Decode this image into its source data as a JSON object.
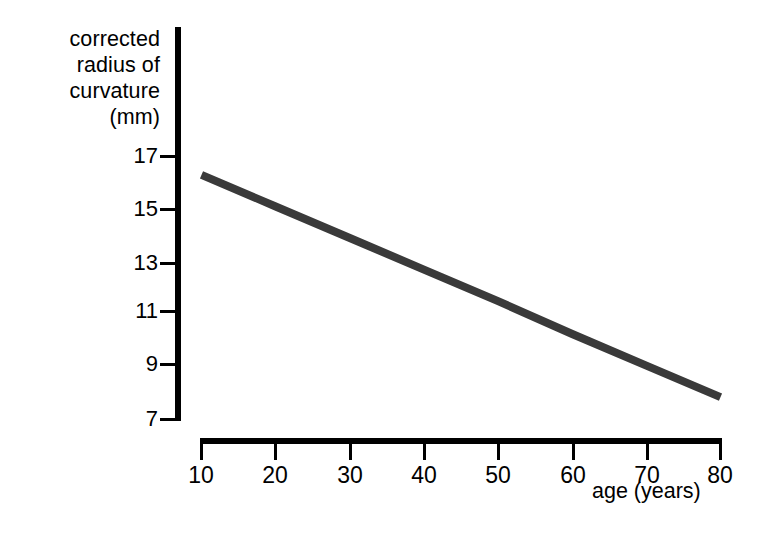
{
  "chart_data": {
    "type": "line",
    "title": "",
    "subtitle": "",
    "xlabel": "age (years)",
    "ylabel": "corrected radius of curvature (mm)",
    "ylabel_lines": [
      "corrected",
      "radius of",
      "curvature",
      "(mm)"
    ],
    "xlim": [
      10,
      80
    ],
    "ylim": [
      7,
      17
    ],
    "xticks": [
      10,
      20,
      30,
      40,
      50,
      60,
      70,
      80
    ],
    "xtick_labels": [
      "10",
      "20",
      "30",
      "40",
      "50",
      "60",
      "70",
      "80"
    ],
    "yticks": [
      17,
      15,
      13,
      11,
      9,
      7
    ],
    "ytick_labels": [
      "17",
      "15",
      "13",
      "11",
      "9",
      "7"
    ],
    "grid": false,
    "legend": null,
    "series": [
      {
        "name": "corrected radius of curvature",
        "x": [
          10,
          20,
          30,
          40,
          50,
          60,
          70,
          80
        ],
        "values": [
          16.3,
          15.1,
          13.9,
          12.7,
          11.5,
          10.25,
          9.05,
          7.85
        ],
        "color": "#3a3a3a",
        "line_width_px": 8,
        "style": "solid"
      }
    ],
    "annotations": []
  },
  "axes": {
    "y_axis_color": "#000000",
    "x_axis_color": "#000000",
    "tick_color": "#000000"
  },
  "figure": {
    "background": "#ffffff"
  }
}
